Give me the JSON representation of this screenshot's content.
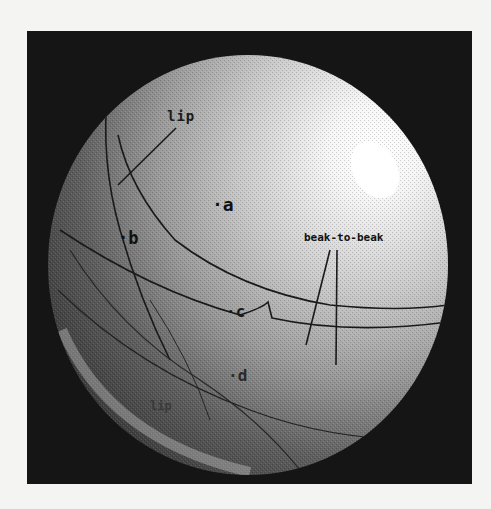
{
  "figure": {
    "colors": {
      "background_page": "#f4f4f2",
      "frame": "#151515",
      "sphere_highlight": "#ffffff",
      "sphere_shadow": "#3a3a3a",
      "curve": "#1a1a1a"
    },
    "labels": {
      "lip_top": "lip",
      "a": "·a",
      "b": "·b",
      "beak_to_beak": "beak-to-beak",
      "c": "·c",
      "d": "·d",
      "lip_bottom": "lip"
    }
  }
}
